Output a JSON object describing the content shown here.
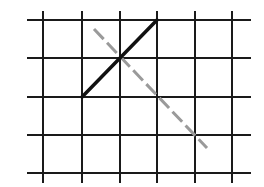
{
  "diagram": {
    "title": "",
    "background": "#ffffff",
    "grid": {
      "color": "#1a1a1a",
      "stroke_width": 2,
      "vertical_x": [
        43,
        82,
        120,
        157,
        195,
        232
      ],
      "vertical_y_range": [
        11,
        183
      ],
      "horizontal_y": [
        20,
        58,
        97,
        135,
        173
      ],
      "horizontal_x_range": [
        27,
        251
      ]
    },
    "solid_line": {
      "color": "#111111",
      "stroke_width": 3.5,
      "from": [
        82,
        97
      ],
      "to": [
        157,
        20
      ]
    },
    "dashed_line": {
      "color": "#9a9a9a",
      "stroke_width": 3,
      "dasharray": "14 5",
      "from": [
        94,
        29
      ],
      "to": [
        207,
        148
      ]
    }
  }
}
